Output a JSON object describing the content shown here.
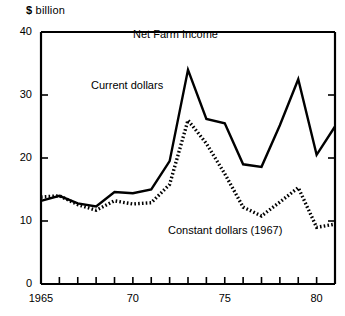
{
  "chart_data": {
    "type": "line",
    "title": "Net Farm Income",
    "ylabel": "$ billion",
    "xlabel": "",
    "grid": false,
    "legend_position": "inline-annotation",
    "xlim": [
      1965,
      1981
    ],
    "ylim": [
      0,
      40
    ],
    "yticks": [
      0,
      10,
      20,
      30,
      40
    ],
    "ytick_labels": [
      "0",
      "10",
      "20",
      "30",
      "40"
    ],
    "xticks": [
      1965,
      1966,
      1967,
      1968,
      1969,
      1970,
      1971,
      1972,
      1973,
      1974,
      1975,
      1976,
      1977,
      1978,
      1979,
      1980,
      1981
    ],
    "xtick_labels": [
      {
        "value": 1965,
        "label": "1965"
      },
      {
        "value": 1970,
        "label": "70"
      },
      {
        "value": 1975,
        "label": "75"
      },
      {
        "value": 1980,
        "label": "80"
      }
    ],
    "x": [
      1965,
      1966,
      1967,
      1968,
      1969,
      1970,
      1971,
      1972,
      1973,
      1974,
      1975,
      1976,
      1977,
      1978,
      1979,
      1980,
      1981
    ],
    "series": [
      {
        "name": "Current dollars",
        "style": "solid",
        "color": "#000000",
        "values": [
          13.2,
          14.0,
          12.8,
          12.3,
          14.6,
          14.4,
          15.0,
          19.5,
          34.0,
          26.2,
          25.5,
          19.0,
          18.6,
          25.2,
          32.5,
          20.5,
          25.0
        ]
      },
      {
        "name": "Constant dollars (1967)",
        "style": "dotted",
        "color": "#000000",
        "values": [
          13.8,
          14.0,
          12.6,
          11.7,
          13.2,
          12.7,
          12.9,
          15.8,
          26.0,
          22.3,
          17.5,
          12.2,
          10.8,
          13.0,
          15.3,
          9.0,
          9.5
        ]
      }
    ],
    "annotations": [
      {
        "name": "current-dollars-label",
        "text": "Current dollars"
      },
      {
        "name": "constant-dollars-label",
        "text": "Constant dollars (1967)"
      }
    ]
  },
  "axis": {
    "unit_symbol": "$",
    "unit_word": "billion"
  }
}
